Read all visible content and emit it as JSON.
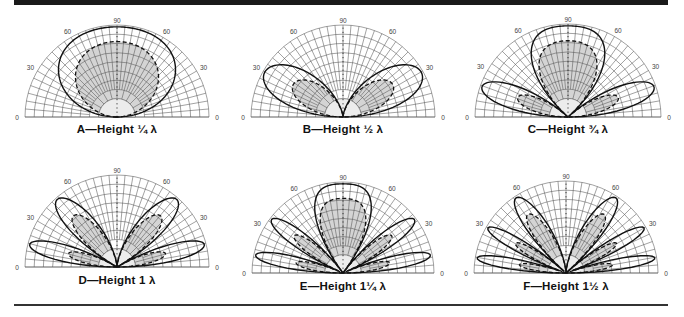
{
  "figure": {
    "panels": [
      {
        "id": "A",
        "caption": "A—Height ¼ λ",
        "height_wavelengths": 0.25,
        "cx": 117,
        "baseline": 117,
        "radius": 92,
        "label_y": 131
      },
      {
        "id": "B",
        "caption": "B—Height ½ λ",
        "height_wavelengths": 0.5,
        "cx": 343,
        "baseline": 117,
        "radius": 92,
        "label_y": 131
      },
      {
        "id": "C",
        "caption": "C—Height ¾ λ",
        "height_wavelengths": 0.75,
        "cx": 568,
        "baseline": 117,
        "radius": 93,
        "label_y": 131
      },
      {
        "id": "D",
        "caption": "D—Height 1 λ",
        "height_wavelengths": 1.0,
        "cx": 117,
        "baseline": 267,
        "radius": 92,
        "label_y": 282
      },
      {
        "id": "E",
        "caption": "E—Height 1¼ λ",
        "height_wavelengths": 1.25,
        "cx": 343,
        "baseline": 273,
        "radius": 91,
        "label_y": 288
      },
      {
        "id": "F",
        "caption": "F—Height 1½ λ",
        "height_wavelengths": 1.5,
        "cx": 566,
        "baseline": 273,
        "radius": 92,
        "label_y": 288
      }
    ],
    "angle_labels": {
      "left_0": "0",
      "left_30": "30",
      "left_60": "60",
      "top_90": "90",
      "right_60": "60",
      "right_30": "30",
      "right_0": "0"
    },
    "colors": {
      "rule": "#1a1a1a",
      "grid": "#555555",
      "fill": "#d4d4d4",
      "pattern": "#111111"
    }
  },
  "chart_data": {
    "type": "polar-elevation-pattern",
    "angle_axis": {
      "range_deg": [
        0,
        180
      ],
      "labeled_ticks": [
        0,
        30,
        60,
        90,
        60,
        30,
        0
      ]
    },
    "series_styles": {
      "solid": "perfect ground",
      "dashed": "real ground",
      "shaded": "pattern area"
    },
    "panels": [
      {
        "label": "A",
        "height": "1/4 λ",
        "lobes": 1
      },
      {
        "label": "B",
        "height": "1/2 λ",
        "lobes": 2
      },
      {
        "label": "C",
        "height": "3/4 λ",
        "lobes": 3
      },
      {
        "label": "D",
        "height": "1 λ",
        "lobes": 4
      },
      {
        "label": "E",
        "height": "1 1/4 λ",
        "lobes": 5
      },
      {
        "label": "F",
        "height": "1 1/2 λ",
        "lobes": 6
      }
    ]
  }
}
